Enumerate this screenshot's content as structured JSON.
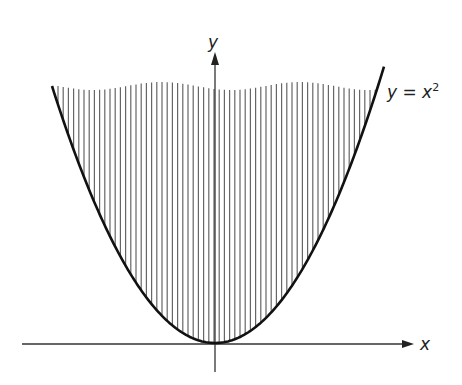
{
  "figure": {
    "type": "parabola-region-diagram",
    "equation_label_lhs": "y = x",
    "equation_label_exp": "2",
    "x_axis_label": "x",
    "y_axis_label": "y",
    "shading": "vertical hatching inside parabola",
    "colors": {
      "curve": "#111111",
      "axes": "#333333",
      "hatch": "#666666",
      "background": "#ffffff"
    }
  }
}
